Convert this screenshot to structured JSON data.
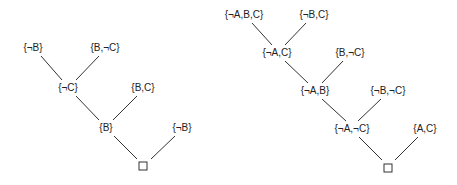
{
  "diagram": {
    "type": "resolution-refutation-trees",
    "colors": {
      "line": "#333333",
      "text": "#222222",
      "background": "#ffffff"
    },
    "trees": [
      {
        "name": "left-tree",
        "nodes": [
          {
            "id": "l1",
            "label": "{¬B}",
            "x": 33,
            "y": 51
          },
          {
            "id": "l2",
            "label": "{B,¬C}",
            "x": 105,
            "y": 51
          },
          {
            "id": "l3",
            "label": "{¬C}",
            "x": 68,
            "y": 91
          },
          {
            "id": "l4",
            "label": "{B,C}",
            "x": 143,
            "y": 91
          },
          {
            "id": "l5",
            "label": "{B}",
            "x": 106,
            "y": 131
          },
          {
            "id": "l6",
            "label": "{¬B}",
            "x": 182,
            "y": 131
          },
          {
            "id": "l7",
            "label": "□",
            "x": 143,
            "y": 166,
            "empty": true
          }
        ],
        "edges": [
          {
            "x1": 41,
            "y1": 56,
            "x2": 62,
            "y2": 80
          },
          {
            "x1": 99,
            "y1": 56,
            "x2": 76,
            "y2": 80
          },
          {
            "x1": 76,
            "y1": 96,
            "x2": 99,
            "y2": 120
          },
          {
            "x1": 137,
            "y1": 96,
            "x2": 113,
            "y2": 120
          },
          {
            "x1": 114,
            "y1": 136,
            "x2": 137,
            "y2": 159
          },
          {
            "x1": 175,
            "y1": 136,
            "x2": 151,
            "y2": 159
          }
        ]
      },
      {
        "name": "right-tree",
        "nodes": [
          {
            "id": "r1",
            "label": "{¬A,B,C}",
            "x": 244,
            "y": 18
          },
          {
            "id": "r2",
            "label": "{¬B,C}",
            "x": 314,
            "y": 18
          },
          {
            "id": "r3",
            "label": "{¬A,C}",
            "x": 277,
            "y": 56
          },
          {
            "id": "r4",
            "label": "{B,¬C}",
            "x": 350,
            "y": 56
          },
          {
            "id": "r5",
            "label": "{¬A,B}",
            "x": 315,
            "y": 94
          },
          {
            "id": "r6",
            "label": "{¬B,¬C}",
            "x": 388,
            "y": 94
          },
          {
            "id": "r7",
            "label": "{¬A,¬C}",
            "x": 352,
            "y": 132
          },
          {
            "id": "r8",
            "label": "{A,C}",
            "x": 425,
            "y": 132
          },
          {
            "id": "r9",
            "label": "□",
            "x": 388,
            "y": 168,
            "empty": true
          }
        ],
        "edges": [
          {
            "x1": 252,
            "y1": 23,
            "x2": 272,
            "y2": 45
          },
          {
            "x1": 306,
            "y1": 23,
            "x2": 285,
            "y2": 45
          },
          {
            "x1": 285,
            "y1": 61,
            "x2": 308,
            "y2": 83
          },
          {
            "x1": 343,
            "y1": 61,
            "x2": 322,
            "y2": 83
          },
          {
            "x1": 322,
            "y1": 99,
            "x2": 346,
            "y2": 121
          },
          {
            "x1": 381,
            "y1": 99,
            "x2": 358,
            "y2": 121
          },
          {
            "x1": 359,
            "y1": 137,
            "x2": 382,
            "y2": 160
          },
          {
            "x1": 418,
            "y1": 137,
            "x2": 395,
            "y2": 160
          }
        ]
      }
    ]
  }
}
